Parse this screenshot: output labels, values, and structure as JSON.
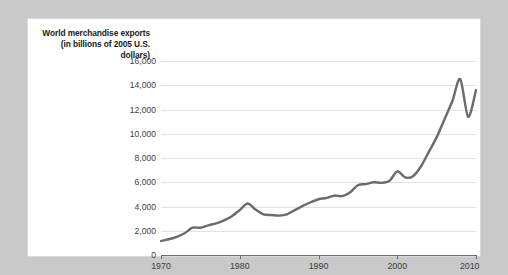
{
  "figure": {
    "caption": "World merchandise exports (in billions of 2005 U.S. dollars)"
  },
  "chart_data": {
    "type": "line",
    "title": "World merchandise exports (in billions of 2005 U.S. dollars)",
    "xlabel": "",
    "ylabel": "World merchandise exports (in billions of 2005 U.S. dollars)",
    "xlim": [
      1970,
      2010
    ],
    "ylim": [
      0,
      16000
    ],
    "grid": true,
    "legend": null,
    "line_color": "#6b6b6b",
    "xticks": [
      1970,
      1980,
      1990,
      2000,
      2010
    ],
    "xtick_labels": [
      "1970",
      "1980",
      "1990",
      "2000",
      "2010"
    ],
    "yticks": [
      0,
      2000,
      4000,
      6000,
      8000,
      10000,
      12000,
      14000,
      16000
    ],
    "ytick_labels": [
      "0",
      "2,000",
      "4,000",
      "6,000",
      "8,000",
      "10,000",
      "12,000",
      "14,000",
      "16,000"
    ],
    "x": [
      1970,
      1971,
      1972,
      1973,
      1974,
      1975,
      1976,
      1977,
      1978,
      1979,
      1980,
      1981,
      1982,
      1983,
      1984,
      1985,
      1986,
      1987,
      1988,
      1989,
      1990,
      1991,
      1992,
      1993,
      1994,
      1995,
      1996,
      1997,
      1998,
      1999,
      2000,
      2001,
      2002,
      2003,
      2004,
      2005,
      2006,
      2007,
      2008,
      2009,
      2010
    ],
    "values": [
      1150,
      1300,
      1500,
      1800,
      2250,
      2250,
      2450,
      2600,
      2850,
      3200,
      3700,
      4250,
      3750,
      3350,
      3300,
      3250,
      3350,
      3700,
      4050,
      4350,
      4600,
      4700,
      4900,
      4850,
      5150,
      5750,
      5850,
      6000,
      5950,
      6100,
      6900,
      6400,
      6500,
      7300,
      8500,
      9700,
      11200,
      12700,
      14500,
      11400,
      13600
    ]
  }
}
